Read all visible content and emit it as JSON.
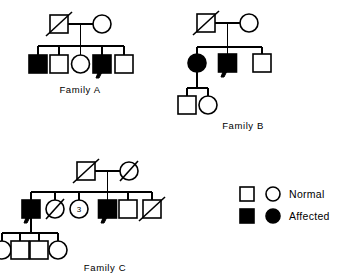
{
  "figure": {
    "background_color": "#ffffff",
    "line_color": "#000000",
    "affected_color": "#000000",
    "normal_color": "#ffffff"
  },
  "families": [
    {
      "id": "family-a",
      "label": "Family A",
      "generations": [
        {
          "name": "generation-i",
          "members": [
            {
              "name": "father",
              "sex": "male",
              "status": "normal",
              "deceased": true,
              "proband": false
            },
            {
              "name": "mother",
              "sex": "female",
              "status": "normal",
              "deceased": false,
              "proband": false
            }
          ]
        },
        {
          "name": "generation-ii",
          "members": [
            {
              "name": "child-1",
              "sex": "male",
              "status": "affected",
              "deceased": false,
              "proband": false
            },
            {
              "name": "child-2",
              "sex": "male",
              "status": "normal",
              "deceased": false,
              "proband": false
            },
            {
              "name": "child-3",
              "sex": "female",
              "status": "normal",
              "deceased": false,
              "proband": false
            },
            {
              "name": "child-4",
              "sex": "male",
              "status": "affected",
              "deceased": false,
              "proband": true
            },
            {
              "name": "child-5",
              "sex": "male",
              "status": "normal",
              "deceased": false,
              "proband": false
            }
          ]
        }
      ]
    },
    {
      "id": "family-b",
      "label": "Family B",
      "generations": [
        {
          "name": "generation-i",
          "members": [
            {
              "name": "father",
              "sex": "male",
              "status": "normal",
              "deceased": true,
              "proband": false
            },
            {
              "name": "mother",
              "sex": "female",
              "status": "normal",
              "deceased": false,
              "proband": false
            }
          ]
        },
        {
          "name": "generation-ii",
          "members": [
            {
              "name": "child-1",
              "sex": "female",
              "status": "affected",
              "deceased": false,
              "proband": false
            },
            {
              "name": "child-2",
              "sex": "male",
              "status": "affected",
              "deceased": false,
              "proband": true
            },
            {
              "name": "child-3",
              "sex": "male",
              "status": "normal",
              "deceased": false,
              "proband": false
            }
          ]
        },
        {
          "name": "generation-iii",
          "members": [
            {
              "name": "grandchild-1",
              "sex": "male",
              "status": "normal",
              "deceased": false,
              "proband": false
            },
            {
              "name": "grandchild-2",
              "sex": "female",
              "status": "normal",
              "deceased": false,
              "proband": false
            }
          ]
        }
      ]
    },
    {
      "id": "family-c",
      "label": "Family C",
      "generations": [
        {
          "name": "generation-i",
          "members": [
            {
              "name": "father",
              "sex": "male",
              "status": "normal",
              "deceased": true,
              "proband": false
            },
            {
              "name": "mother",
              "sex": "female",
              "status": "normal",
              "deceased": true,
              "proband": false
            }
          ]
        },
        {
          "name": "generation-ii",
          "members": [
            {
              "name": "child-1",
              "sex": "male",
              "status": "affected",
              "deceased": false,
              "proband": true
            },
            {
              "name": "child-2",
              "sex": "female",
              "status": "normal",
              "deceased": true,
              "proband": false
            },
            {
              "name": "child-3",
              "sex": "female",
              "status": "normal",
              "deceased": false,
              "proband": false,
              "count": "3"
            },
            {
              "name": "child-4",
              "sex": "male",
              "status": "affected",
              "deceased": false,
              "proband": true
            },
            {
              "name": "child-5",
              "sex": "male",
              "status": "normal",
              "deceased": false,
              "proband": false
            },
            {
              "name": "child-6",
              "sex": "male",
              "status": "normal",
              "deceased": true,
              "proband": false
            }
          ]
        },
        {
          "name": "generation-iii",
          "members": [
            {
              "name": "grandchild-1",
              "sex": "female",
              "status": "normal",
              "deceased": false,
              "proband": false
            },
            {
              "name": "grandchild-2",
              "sex": "male",
              "status": "normal",
              "deceased": false,
              "proband": false
            },
            {
              "name": "grandchild-3",
              "sex": "male",
              "status": "normal",
              "deceased": false,
              "proband": false
            },
            {
              "name": "grandchild-4",
              "sex": "female",
              "status": "normal",
              "deceased": false,
              "proband": false
            }
          ]
        }
      ]
    }
  ],
  "legend": {
    "rows": [
      {
        "key": "normal",
        "label": "Normal",
        "square_fill": "#ffffff",
        "circle_fill": "#ffffff"
      },
      {
        "key": "affected",
        "label": "Affected",
        "square_fill": "#000000",
        "circle_fill": "#000000"
      }
    ]
  },
  "labels": {
    "family_a": "Family A",
    "family_b": "Family B",
    "family_c": "Family C",
    "legend_normal": "Normal",
    "legend_affected": "Affected",
    "sibling_count_c3": "3"
  }
}
